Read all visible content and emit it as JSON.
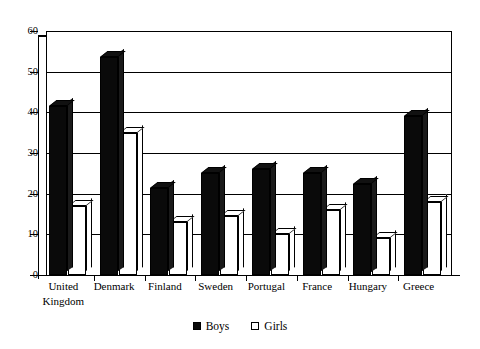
{
  "chart_data": {
    "type": "bar",
    "title": "",
    "xlabel": "",
    "ylabel": "",
    "ylim": [
      0,
      60
    ],
    "yticks": [
      0,
      10,
      20,
      30,
      40,
      50,
      60
    ],
    "grid": true,
    "legend_position": "bottom",
    "style": "3d-column",
    "categories": [
      "United Kingdom",
      "Denmark",
      "Finland",
      "Sweden",
      "Portugal",
      "France",
      "Hungary",
      "Greece"
    ],
    "category_lines": [
      [
        "United",
        "Kingdom"
      ],
      [
        "Denmark"
      ],
      [
        "Finland"
      ],
      [
        "Sweden"
      ],
      [
        "Portugal"
      ],
      [
        "France"
      ],
      [
        "Hungary"
      ],
      [
        "Greece"
      ]
    ],
    "series": [
      {
        "name": "Boys",
        "color": "#0a0a0a",
        "fill": "solid",
        "values": [
          41.5,
          53.5,
          21.5,
          25,
          26,
          25,
          22.5,
          39
        ]
      },
      {
        "name": "Girls",
        "color": "#ffffff",
        "fill": "hollow",
        "values": [
          17,
          35,
          13,
          14.5,
          10,
          16,
          9,
          18
        ]
      }
    ]
  },
  "legend": {
    "items": [
      {
        "label": "Boys",
        "swatch": "filled-square-icon"
      },
      {
        "label": "Girls",
        "swatch": "hollow-square-icon"
      }
    ]
  },
  "axis": {
    "y_tick_labels": [
      "0",
      "10",
      "20",
      "30",
      "40",
      "50",
      "60"
    ]
  }
}
